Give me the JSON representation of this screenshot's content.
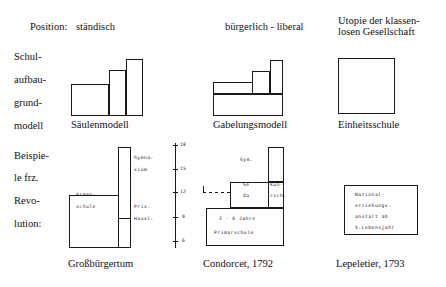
{
  "figure": {
    "row_labels": {
      "position": "Position:",
      "model_l1": "Schul-",
      "model_l2": "aufbau-",
      "model_l3": "grund-",
      "model_l4": "modell",
      "example_l1": "Beispie-",
      "example_l2": "le frz.",
      "example_l3": "Revo-",
      "example_l4": "lution:"
    },
    "columns": [
      {
        "position": "ständisch",
        "model_name": "Säulenmodell",
        "example_caption": "Großbürgertum",
        "labels": {
          "armenschule_l1": "Armen-",
          "armenschule_l2": "schule",
          "gymnasium_l1": "Gymna-",
          "gymnasium_l2": "sium",
          "privat_l1": "Priv.",
          "privat_l2": "Hausl."
        }
      },
      {
        "position": "bürgerlich - liberal",
        "model_name": "Gabelungsmodell",
        "example_caption": "Condorcet, 1792",
        "labels": {
          "gymnasium": "Gym.",
          "sekundar_l1a": "Se",
          "sekundar_l1b": "kun-",
          "sekundar_l2a": "da",
          "sekundar_l2b": "rsch.",
          "primar_l1": "3 - 6 Jahre",
          "primar_l2": "Primarschule"
        },
        "age_axis": {
          "ticks": [
            "18",
            "15",
            "12",
            "9",
            "6"
          ]
        }
      },
      {
        "position_l1": "Utopie der klassen-",
        "position_l2": "losen Gesellschaft",
        "model_name": "Einheitsschule",
        "example_caption": "Lepeletier, 1793",
        "labels": {
          "national_l1": "National-",
          "national_l2": "erziehungs-",
          "national_l3": "anstalt ab",
          "national_l4": "5.Lebensjahr"
        }
      }
    ]
  }
}
